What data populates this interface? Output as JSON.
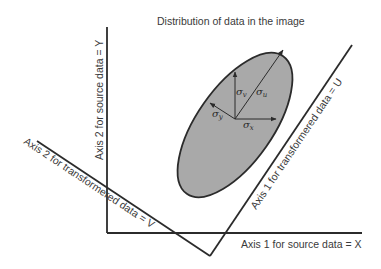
{
  "title": "Distribution of data in the image",
  "axes": {
    "source_x": "Axis 1 for source data = X",
    "source_y": "Axis 2 for source  data = Y",
    "transformed_u": "Axis 1 for transformered data = U",
    "transformed_v": "Axis 2 for transformered data = V"
  },
  "sigmas": {
    "u": {
      "symbol": "σ",
      "sub": "u"
    },
    "v": {
      "symbol": "σ",
      "sub": "v"
    },
    "x": {
      "symbol": "σ",
      "sub": "x"
    },
    "y": {
      "symbol": "σ",
      "sub": "y"
    }
  },
  "colors": {
    "line": "#2b2b2b",
    "ellipse_fill": "#a9a9a9",
    "text": "#3a3a3a",
    "background": "#ffffff"
  }
}
